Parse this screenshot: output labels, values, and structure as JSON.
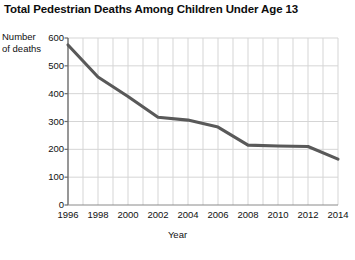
{
  "chart_data": {
    "type": "line",
    "title": "Total Pedestrian Deaths Among Children Under Age 13",
    "xlabel": "Year",
    "ylabel": "Number of deaths",
    "ylabel_lines": [
      "Number",
      "of deaths"
    ],
    "x": [
      1996,
      1998,
      2000,
      2002,
      2004,
      2006,
      2008,
      2010,
      2012,
      2014
    ],
    "values": [
      575,
      460,
      390,
      315,
      305,
      280,
      215,
      212,
      210,
      165
    ],
    "series": [
      {
        "name": "Pedestrian deaths",
        "values": [
          575,
          460,
          390,
          315,
          305,
          280,
          215,
          212,
          210,
          165
        ]
      }
    ],
    "xlim": [
      1996,
      2014
    ],
    "ylim": [
      0,
      600
    ],
    "yticks": [
      0,
      100,
      200,
      300,
      400,
      500,
      600
    ],
    "ytick_labels": [
      "0",
      "100",
      "200",
      "300",
      "400",
      "500",
      "600"
    ],
    "xticks": [
      1996,
      1998,
      2000,
      2002,
      2004,
      2006,
      2008,
      2010,
      2012,
      2014
    ],
    "xtick_labels": [
      "1996",
      "1998",
      "2000",
      "2002",
      "2004",
      "2006",
      "2008",
      "2010",
      "2012",
      "2014"
    ],
    "grid": true,
    "grid_x_step": 1,
    "grid_y_step": 100,
    "legend": false,
    "line_color": "#595959",
    "grid_color": "#d5d5d5",
    "axis_color": "#8a8a8a",
    "spine_color": "#6b6b6b",
    "background": "#ffffff"
  }
}
